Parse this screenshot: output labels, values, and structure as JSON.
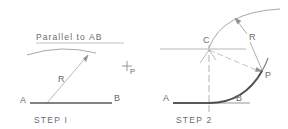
{
  "figure": {
    "title_note": "Parallel to AB",
    "colors": {
      "construction_line": "#9a9aa0",
      "thin_line": "#b0b0b6",
      "heavy_line": "#54545a",
      "text": "#6b6b6f",
      "background": "#ffffff"
    },
    "steps": [
      {
        "caption": "STEP I",
        "note": "Parallel to AB",
        "labels": {
          "point_a": "A",
          "point_b": "B",
          "radius": "R",
          "point_p": "P"
        }
      },
      {
        "caption": "STEP 2",
        "labels": {
          "point_a": "A",
          "point_b": "B",
          "point_c": "C",
          "point_p": "P",
          "radius": "R"
        }
      }
    ]
  }
}
